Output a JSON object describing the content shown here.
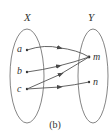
{
  "diagram": {
    "caption": "(b)",
    "domain_set": {
      "label": "X",
      "elements": [
        {
          "label": "a",
          "x": 27,
          "y": 50
        },
        {
          "label": "b",
          "x": 27,
          "y": 72
        },
        {
          "label": "c",
          "x": 27,
          "y": 89
        }
      ]
    },
    "codomain_set": {
      "label": "Y",
      "elements": [
        {
          "label": "m",
          "x": 89,
          "y": 57
        },
        {
          "label": "n",
          "x": 89,
          "y": 82
        }
      ]
    },
    "mappings": [
      {
        "from": "a",
        "to": "m"
      },
      {
        "from": "b",
        "to": "m"
      },
      {
        "from": "c",
        "to": "m"
      },
      {
        "from": "c",
        "to": "n"
      }
    ],
    "colors": {
      "stroke": "#555555",
      "text": "#333333",
      "background": "#ffffff"
    }
  }
}
